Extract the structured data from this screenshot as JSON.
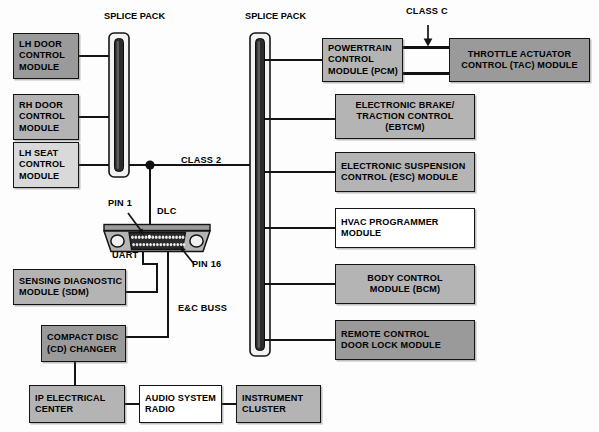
{
  "diagram": {
    "background_color": "#fdfdfd",
    "line_color": "#141414"
  },
  "labels": {
    "splice_pack_left_l1": "SPLICE",
    "splice_pack_left_l2": "PACK",
    "splice_pack_right_l1": "SPLICE",
    "splice_pack_right_l2": "PACK",
    "class_2": "CLASS 2",
    "class_c": "CLASS C",
    "dlc": "DLC",
    "pin_1": "PIN 1",
    "pin_16": "PIN 16",
    "uart": "UART",
    "ec_buss_l1": "E&C",
    "ec_buss_l2": "BUSS"
  },
  "modules": {
    "lh_door": {
      "lines": [
        "LH DOOR",
        "CONTROL",
        "MODULE"
      ],
      "fill": "#9a9a9a"
    },
    "rh_door": {
      "lines": [
        "RH DOOR",
        "CONTROL",
        "MODULE"
      ],
      "fill": "#b4b4b4"
    },
    "lh_seat": {
      "lines": [
        "LH SEAT",
        "CONTROL",
        "MODULE"
      ],
      "fill": "#d9d9d9"
    },
    "sdm": {
      "lines": [
        "SENSING DIAGNOSTIC",
        "MODULE (SDM)"
      ],
      "fill": "#b4b4b4"
    },
    "cd_changer": {
      "lines": [
        "COMPACT DISC",
        "(CD) CHANGER"
      ],
      "fill": "#9a9a9a"
    },
    "ip_electrical": {
      "lines": [
        "IP ELECTRICAL",
        "CENTER"
      ],
      "fill": "#b4b4b4"
    },
    "audio_radio": {
      "lines": [
        "AUDIO SYSTEM",
        "RADIO"
      ],
      "fill": "#ffffff"
    },
    "instrument_cluster": {
      "lines": [
        "INSTRUMENT",
        "CLUSTER"
      ],
      "fill": "#b4b4b4"
    },
    "pcm": {
      "lines": [
        "POWERTRAIN",
        "CONTROL",
        "MODULE (PCM)"
      ],
      "fill": "#b4b4b4"
    },
    "tac": {
      "lines": [
        "THROTTLE ACTUATOR",
        "CONTROL (TAC) MODULE"
      ],
      "fill": "#9a9a9a"
    },
    "ebtcm": {
      "lines": [
        "ELECTRONIC BRAKE/",
        "TRACTION CONTROL",
        "(EBTCM)"
      ],
      "fill": "#b4b4b4"
    },
    "esc": {
      "lines": [
        "ELECTRONIC SUSPENSION",
        "CONTROL (ESC) MODULE"
      ],
      "fill": "#b4b4b4"
    },
    "hvac": {
      "lines": [
        "HVAC PROGRAMMER",
        "MODULE"
      ],
      "fill": "#ffffff"
    },
    "bcm": {
      "lines": [
        "BODY CONTROL",
        "MODULE (BCM)"
      ],
      "fill": "#b4b4b4"
    },
    "rcdlm": {
      "lines": [
        "REMOTE CONTROL",
        "DOOR LOCK MODULE"
      ],
      "fill": "#9a9a9a"
    }
  },
  "connector": {
    "name": "DLC",
    "pin_rows": 2,
    "pins_per_row": 16
  }
}
